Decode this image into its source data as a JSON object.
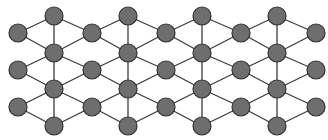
{
  "diagram": {
    "type": "lattice-graph",
    "background": "#ffffff",
    "node_fill": "#6e6e6e",
    "node_stroke": "#333333",
    "edge_color": "#3c3c3c",
    "node_radius": 9,
    "odd_columns": {
      "x": [
        18,
        92,
        166,
        241,
        316
      ],
      "y": [
        33,
        70,
        107
      ]
    },
    "even_columns": {
      "x": [
        54,
        128,
        202,
        277
      ],
      "y": [
        16,
        53,
        89,
        126
      ]
    }
  }
}
